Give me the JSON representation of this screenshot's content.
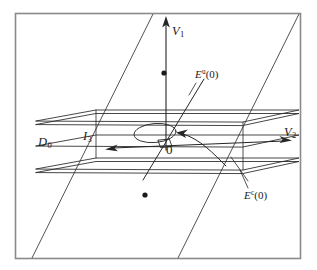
{
  "figure": {
    "kind": "mathematical-diagram",
    "frame": {
      "border_color": "#8a8a8a",
      "background": "#ffffff"
    },
    "ink_color": "#262626",
    "labels": {
      "v1": {
        "base": "V",
        "sub": "1"
      },
      "v2": {
        "base": "V",
        "sub": "2"
      },
      "eu": {
        "base": "E",
        "sup": "u",
        "arg": "(0)"
      },
      "ec": {
        "base": "E",
        "sup": "c",
        "arg": "(0)"
      },
      "d0": {
        "base": "D",
        "sub": "0"
      },
      "i3": {
        "base": "I",
        "sub": "3"
      },
      "origin": "0"
    },
    "elements": [
      {
        "name": "outer-parallelogram",
        "role": "ambient vertical plane"
      },
      {
        "name": "upper-slab-plane",
        "role": "top boundary of slab"
      },
      {
        "name": "lower-slab-plane",
        "role": "bottom boundary of slab"
      },
      {
        "name": "center-plane",
        "role": "center subspace E^c(0)"
      },
      {
        "name": "v1-axis",
        "role": "vertical coordinate axis, arrow up"
      },
      {
        "name": "v2-axis",
        "role": "horizontal coordinate axis, arrows both ends"
      },
      {
        "name": "unstable-line",
        "role": "E^u(0) transverse direction"
      },
      {
        "name": "flow-ellipse",
        "role": "rotational flow about origin"
      },
      {
        "name": "flow-arc",
        "role": "curved trajectory arrow"
      },
      {
        "name": "right-angle-mark",
        "role": "transversality marker at origin"
      },
      {
        "name": "upper-dot",
        "role": "point above slab"
      },
      {
        "name": "lower-dot",
        "role": "point below slab"
      }
    ]
  }
}
